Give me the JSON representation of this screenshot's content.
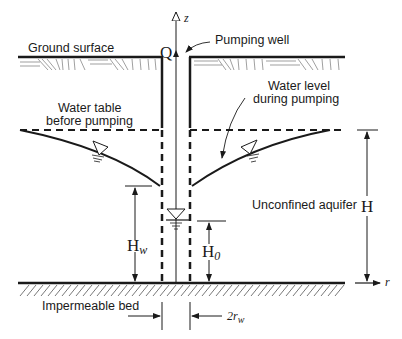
{
  "diagram": {
    "title_labels": {
      "ground_surface": "Ground surface",
      "pumping_well": "Pumping well",
      "water_table_line1": "Water table",
      "water_table_line2": "before pumping",
      "water_level_line1": "Water level",
      "water_level_line2": "during pumping",
      "unconfined_aquifer": "Unconfined aquifer",
      "impermeable_bed": "Impermeable bed"
    },
    "symbols": {
      "discharge": "Q",
      "z_axis": "z",
      "r_axis": "r",
      "H": "H",
      "Hw_main": "H",
      "Hw_sub": "w",
      "H0_main": "H",
      "H0_sub": "0",
      "two_rw_main": "2r",
      "two_rw_sub": "w"
    },
    "colors": {
      "line": "#1a1a1a",
      "hatch": "#555555",
      "background": "#ffffff"
    }
  }
}
